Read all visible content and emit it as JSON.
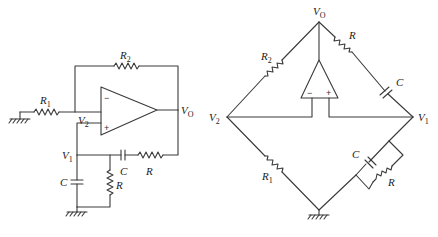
{
  "figure": {
    "left_circuit": {
      "title": "Wien-bridge oscillator (schematic form)",
      "labels": {
        "R1": {
          "main": "R",
          "sub": "1"
        },
        "R2": {
          "main": "R",
          "sub": "2"
        },
        "V2": {
          "main": "V",
          "sub": "2"
        },
        "VO": {
          "main": "V",
          "sub": "O"
        },
        "V1": {
          "main": "V",
          "sub": "1"
        },
        "C_series": "C",
        "R_series": "R",
        "C_shunt": "C",
        "R_shunt": "R"
      },
      "opamp": {
        "minus": "−",
        "plus": "+"
      }
    },
    "right_circuit": {
      "title": "Wien-bridge oscillator (bridge form)",
      "labels": {
        "VO": {
          "main": "V",
          "sub": "O"
        },
        "R2": {
          "main": "R",
          "sub": "2"
        },
        "R_top": "R",
        "C_top": "C",
        "V2": {
          "main": "V",
          "sub": "2"
        },
        "V1": {
          "main": "V",
          "sub": "1"
        },
        "R1": {
          "main": "R",
          "sub": "1"
        },
        "C_bottom": "C",
        "R_bottom": "R"
      },
      "opamp": {
        "minus": "−",
        "plus": "+"
      }
    },
    "colors": {
      "line": "#3a3a3a",
      "text": "#222222",
      "background": "#ffffff"
    }
  }
}
